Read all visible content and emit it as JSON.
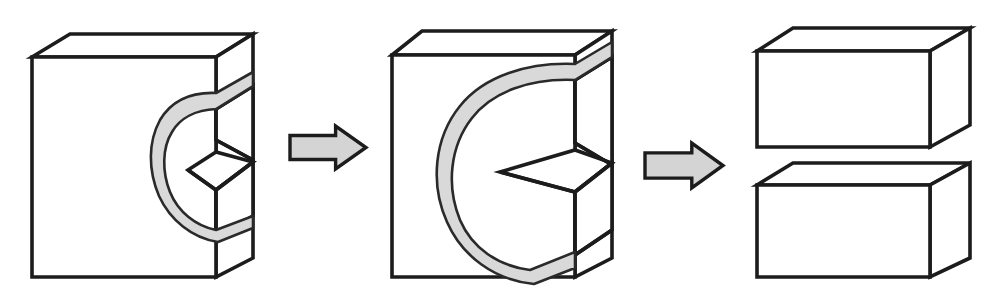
{
  "figure": {
    "title": "Block separation by curved kerf cut",
    "background_color": "#ffffff",
    "line_color": "#1c1c1c",
    "kerf_fill_color": "#d9d9d9",
    "arrow_fill_color": "#d4d4d4",
    "width": 1004,
    "height": 291,
    "stage_count": 3,
    "arrow_count": 2
  },
  "stages": [
    {
      "index": 1,
      "name": "partial-cut-block",
      "label": "",
      "description": "Solid rectangular block with a shallow C-shaped kerf entering from the right face",
      "kerf_depth": "shallow",
      "pieces": 1
    },
    {
      "index": 2,
      "name": "deep-cut-block",
      "label": "",
      "description": "Same block with the C-shaped kerf advanced deeper toward the left face",
      "kerf_depth": "deep",
      "pieces": 1
    },
    {
      "index": 3,
      "name": "separated-blocks",
      "label": "",
      "description": "Block fully severed into an upper and a lower rectangular piece",
      "kerf_depth": "through",
      "pieces": 2
    }
  ],
  "arrows": [
    {
      "index": 1,
      "name": "process-arrow-1",
      "label": "",
      "direction": "right"
    },
    {
      "index": 2,
      "name": "process-arrow-2",
      "label": "",
      "direction": "right"
    }
  ],
  "geometry": {
    "block1": {
      "front": [
        [
          32,
          57
        ],
        [
          216,
          57
        ],
        [
          216,
          277
        ],
        [
          32,
          277
        ]
      ],
      "top": [
        [
          32,
          57
        ],
        [
          70,
          34
        ],
        [
          253,
          34
        ],
        [
          216,
          57
        ]
      ],
      "right": [
        [
          216,
          57
        ],
        [
          253,
          34
        ],
        [
          253,
          258
        ],
        [
          216,
          277
        ]
      ],
      "notch_front_top": [
        [
          188,
          140
        ],
        [
          216,
          140
        ]
      ],
      "notch_front_bottom": [
        [
          188,
          190
        ],
        [
          216,
          190
        ]
      ]
    },
    "block2": {
      "front": [
        [
          392,
          55
        ],
        [
          575,
          55
        ],
        [
          575,
          277
        ],
        [
          392,
          277
        ]
      ],
      "top": [
        [
          392,
          55
        ],
        [
          422,
          31
        ],
        [
          612,
          31
        ],
        [
          575,
          55
        ]
      ],
      "right": [
        [
          575,
          55
        ],
        [
          612,
          31
        ],
        [
          612,
          258
        ],
        [
          575,
          277
        ]
      ],
      "notch_front_top": [
        [
          500,
          143
        ],
        [
          575,
          143
        ]
      ],
      "notch_front_bottom": [
        [
          500,
          192
        ],
        [
          575,
          192
        ]
      ]
    },
    "block3_upper": {
      "front": [
        [
          757,
          51
        ],
        [
          930,
          51
        ],
        [
          930,
          147
        ],
        [
          757,
          147
        ]
      ],
      "top": [
        [
          757,
          51
        ],
        [
          793,
          28
        ],
        [
          970,
          28
        ],
        [
          930,
          51
        ]
      ],
      "right": [
        [
          930,
          51
        ],
        [
          970,
          28
        ],
        [
          970,
          125
        ],
        [
          930,
          147
        ]
      ]
    },
    "block3_lower": {
      "front": [
        [
          757,
          185
        ],
        [
          930,
          185
        ],
        [
          930,
          277
        ],
        [
          757,
          277
        ]
      ],
      "top": [
        [
          757,
          185
        ],
        [
          793,
          163
        ],
        [
          970,
          163
        ],
        [
          930,
          185
        ]
      ],
      "right": [
        [
          930,
          185
        ],
        [
          970,
          163
        ],
        [
          970,
          258
        ],
        [
          930,
          277
        ]
      ]
    },
    "arrow1": {
      "x": 290,
      "y": 126,
      "width": 76,
      "height": 43
    },
    "arrow2": {
      "x": 645,
      "y": 143,
      "width": 78,
      "height": 45
    }
  }
}
